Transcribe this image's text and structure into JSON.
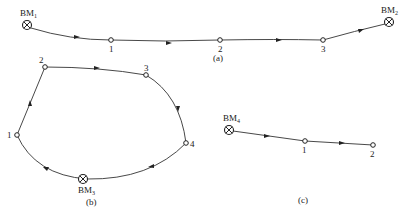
{
  "figure": {
    "panels": [
      {
        "id": "a",
        "caption": "(a)",
        "type": "annexed leveling route",
        "start_benchmark": {
          "name": "BM",
          "sub": "1"
        },
        "points": [
          "1",
          "2",
          "3"
        ],
        "end_benchmark": {
          "name": "BM",
          "sub": "2"
        }
      },
      {
        "id": "b",
        "caption": "(b)",
        "type": "closed leveling loop",
        "benchmark": {
          "name": "BM",
          "sub": "3"
        },
        "points": [
          "1",
          "2",
          "3",
          "4"
        ]
      },
      {
        "id": "c",
        "caption": "(c)",
        "type": "spur leveling route",
        "benchmark": {
          "name": "BM",
          "sub": "4"
        },
        "points": [
          "1",
          "2"
        ]
      }
    ]
  }
}
